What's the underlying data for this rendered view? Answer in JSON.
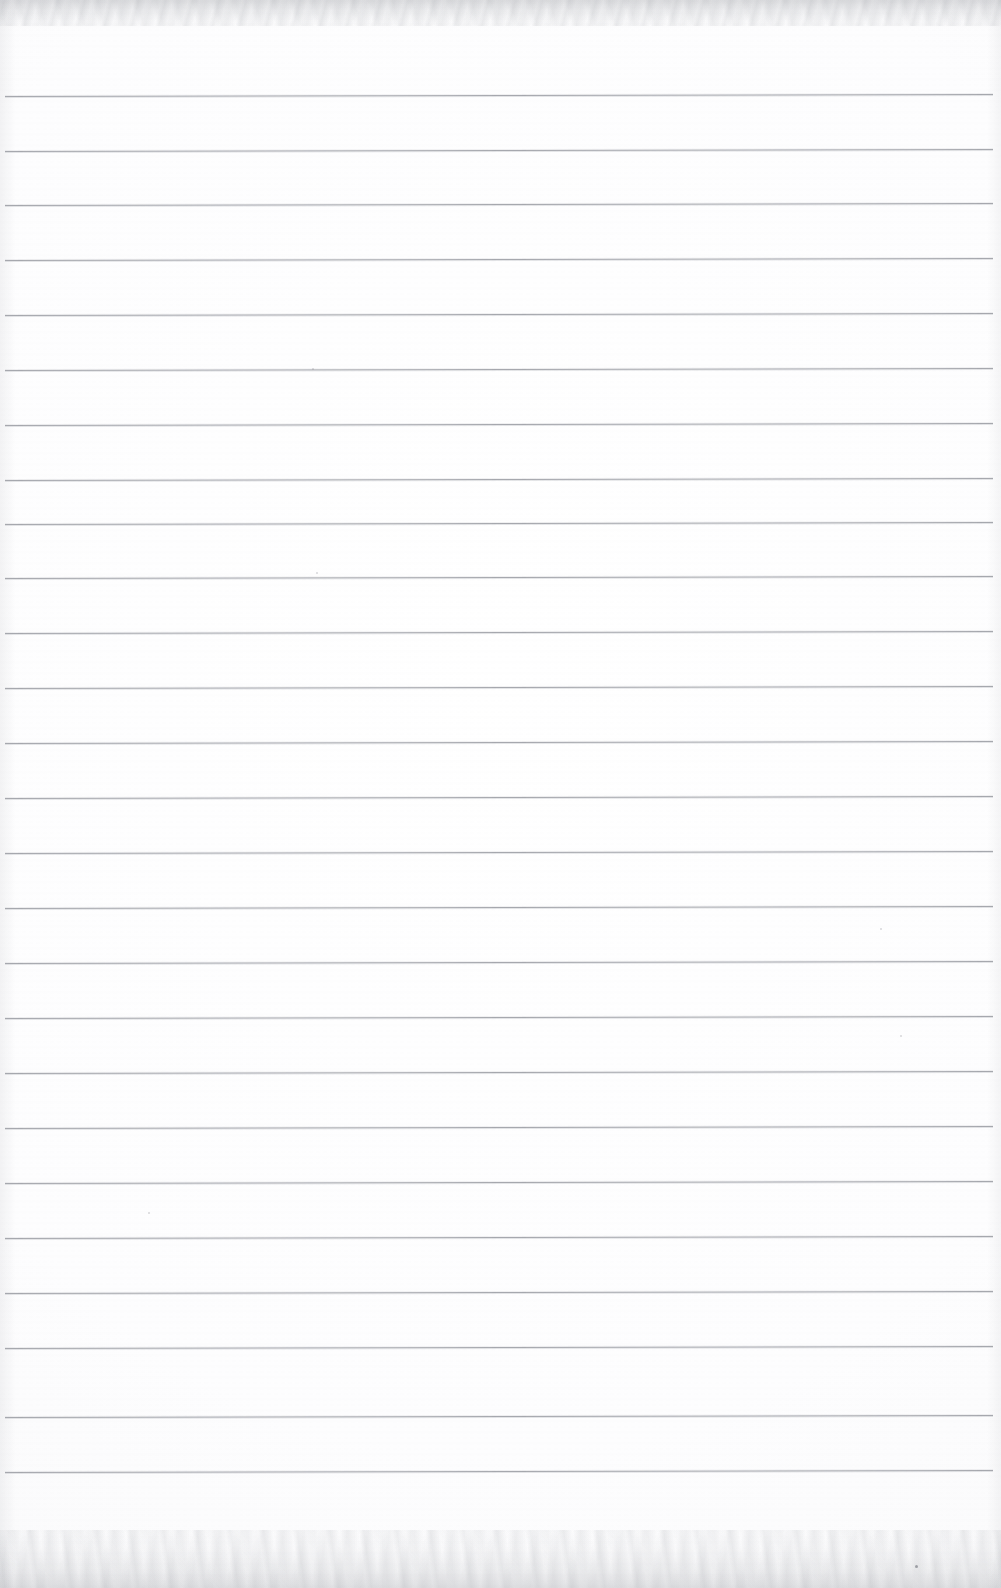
{
  "document": {
    "kind": "scanned-page",
    "description": "Blank ruled notebook page scan",
    "page_width": 1001,
    "page_height": 1588,
    "paper_color": "#fdfdfe",
    "rule_color": "#a6a8ae",
    "edge_shadow_color": "#96989e",
    "text_content": "",
    "visible_text": []
  },
  "ruling": {
    "line_count": 26,
    "first_line_y": 96,
    "line_spacing": 55,
    "line_left_x": 5,
    "line_right_x": 993,
    "line_thickness": 1,
    "tilt_degrees": -0.12,
    "lines": [
      {
        "index": 1,
        "y": 96,
        "x1": 5,
        "x2": 993
      },
      {
        "index": 2,
        "y": 151,
        "x1": 5,
        "x2": 993
      },
      {
        "index": 3,
        "y": 205,
        "x1": 5,
        "x2": 993
      },
      {
        "index": 4,
        "y": 260,
        "x1": 5,
        "x2": 993
      },
      {
        "index": 5,
        "y": 315,
        "x1": 5,
        "x2": 993
      },
      {
        "index": 6,
        "y": 370,
        "x1": 5,
        "x2": 993
      },
      {
        "index": 7,
        "y": 425,
        "x1": 5,
        "x2": 993
      },
      {
        "index": 8,
        "y": 480,
        "x1": 5,
        "x2": 993
      },
      {
        "index": 9,
        "y": 524,
        "x1": 5,
        "x2": 993
      },
      {
        "index": 10,
        "y": 578,
        "x1": 5,
        "x2": 993
      },
      {
        "index": 11,
        "y": 633,
        "x1": 5,
        "x2": 993
      },
      {
        "index": 12,
        "y": 688,
        "x1": 5,
        "x2": 993
      },
      {
        "index": 13,
        "y": 743,
        "x1": 5,
        "x2": 993
      },
      {
        "index": 14,
        "y": 798,
        "x1": 5,
        "x2": 993
      },
      {
        "index": 15,
        "y": 853,
        "x1": 5,
        "x2": 993
      },
      {
        "index": 16,
        "y": 908,
        "x1": 5,
        "x2": 993
      },
      {
        "index": 17,
        "y": 963,
        "x1": 5,
        "x2": 993
      },
      {
        "index": 18,
        "y": 1018,
        "x1": 5,
        "x2": 993
      },
      {
        "index": 19,
        "y": 1073,
        "x1": 5,
        "x2": 993
      },
      {
        "index": 20,
        "y": 1128,
        "x1": 5,
        "x2": 993
      },
      {
        "index": 21,
        "y": 1183,
        "x1": 5,
        "x2": 993
      },
      {
        "index": 22,
        "y": 1238,
        "x1": 5,
        "x2": 993
      },
      {
        "index": 23,
        "y": 1293,
        "x1": 5,
        "x2": 993
      },
      {
        "index": 24,
        "y": 1348,
        "x1": 5,
        "x2": 993
      },
      {
        "index": 25,
        "y": 1417,
        "x1": 5,
        "x2": 993
      },
      {
        "index": 26,
        "y": 1472,
        "x1": 5,
        "x2": 993
      }
    ]
  },
  "artifacts": {
    "top_band": {
      "height": 30,
      "color": "#96989e"
    },
    "bottom_band": {
      "height": 62,
      "color": "#96989e"
    },
    "specks": [
      {
        "x": 915,
        "y": 1565,
        "size": 3
      },
      {
        "x": 312,
        "y": 368,
        "size": 2
      },
      {
        "x": 880,
        "y": 928,
        "size": 2
      },
      {
        "x": 316,
        "y": 572,
        "size": 2
      },
      {
        "x": 148,
        "y": 1212,
        "size": 2
      },
      {
        "x": 900,
        "y": 1035,
        "size": 2
      }
    ]
  }
}
